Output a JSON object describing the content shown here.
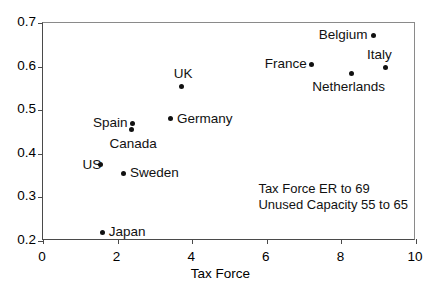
{
  "chart_data": {
    "type": "scatter",
    "title": "",
    "xlabel": "Tax Force",
    "ylabel": "",
    "xlim": [
      0,
      10
    ],
    "ylim": [
      0.2,
      0.7
    ],
    "xticks": [
      "0",
      "2",
      "4",
      "6",
      "8",
      "10"
    ],
    "xtick_values": [
      0,
      2,
      4,
      6,
      8,
      10
    ],
    "yticks": [
      "0.2",
      "0.3",
      "0.4",
      "0.5",
      "0.6",
      "0.7"
    ],
    "ytick_values": [
      0.2,
      0.3,
      0.4,
      0.5,
      0.6,
      0.7
    ],
    "grid": false,
    "legend": false,
    "marker_color": "#111111",
    "axis_color": "#4a4a4a",
    "points": [
      {
        "label": "Japan",
        "x": 1.6,
        "y": 0.22,
        "label_pos": "right"
      },
      {
        "label": "US",
        "x": 1.55,
        "y": 0.375,
        "label_pos": "left"
      },
      {
        "label": "Sweden",
        "x": 2.17,
        "y": 0.355,
        "label_pos": "right"
      },
      {
        "label": "Canada",
        "x": 2.36,
        "y": 0.455,
        "label_pos": "below"
      },
      {
        "label": "Spain",
        "x": 2.41,
        "y": 0.47,
        "label_pos": "left"
      },
      {
        "label": "Germany",
        "x": 3.43,
        "y": 0.48,
        "label_pos": "right"
      },
      {
        "label": "UK",
        "x": 3.7,
        "y": 0.555,
        "label_pos": "above"
      },
      {
        "label": "France",
        "x": 7.21,
        "y": 0.605,
        "label_pos": "left"
      },
      {
        "label": "Netherlands",
        "x": 8.28,
        "y": 0.585,
        "label_pos": "below"
      },
      {
        "label": "Belgium",
        "x": 8.85,
        "y": 0.672,
        "label_pos": "left"
      },
      {
        "label": "Italy",
        "x": 9.17,
        "y": 0.598,
        "label_pos": "above"
      }
    ],
    "annotations": [
      "Tax Force ER to 69",
      "Unused Capacity 55 to 65"
    ]
  }
}
